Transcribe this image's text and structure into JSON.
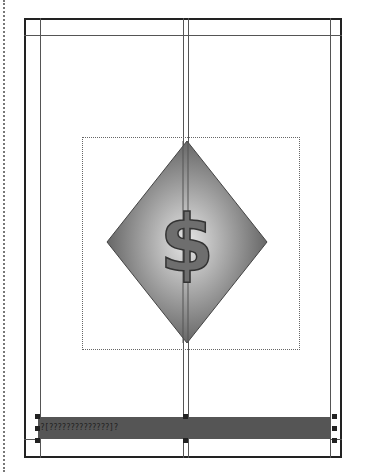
{
  "layout": {
    "title": "Page layout with diamond dollar graphic",
    "colors": {
      "frame": "#222222",
      "guide": "#555555",
      "bar": "#555555",
      "diamond_edge": "#5a5a5a",
      "diamond_center": "#e6e6e6",
      "dollar_fill": "#6e6e6e",
      "dollar_stroke": "#333333"
    }
  },
  "graphic": {
    "symbol": "$",
    "shape": "diamond"
  },
  "footer_bar": {
    "text": "?[??????????????]?"
  }
}
